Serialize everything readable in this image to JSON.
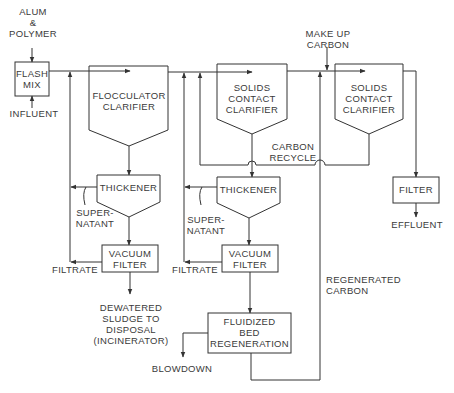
{
  "diagram": {
    "type": "process-flow",
    "colors": {
      "line": "#333333",
      "text": "#3a3a3a",
      "background": "#ffffff"
    },
    "units": [
      {
        "id": "flash_mix",
        "lines": [
          "FLASH",
          "MIX"
        ]
      },
      {
        "id": "flocculator_clarifier",
        "lines": [
          "FLOCCULATOR",
          "CLARIFIER"
        ]
      },
      {
        "id": "solids_contact_clarifier_1",
        "lines": [
          "SOLIDS",
          "CONTACT",
          "CLARIFIER"
        ]
      },
      {
        "id": "solids_contact_clarifier_2",
        "lines": [
          "SOLIDS",
          "CONTACT",
          "CLARIFIER"
        ]
      },
      {
        "id": "thickener_1",
        "lines": [
          "THICKENER"
        ]
      },
      {
        "id": "thickener_2",
        "lines": [
          "THICKENER"
        ]
      },
      {
        "id": "vacuum_filter_1",
        "lines": [
          "VACUUM",
          "FILTER"
        ]
      },
      {
        "id": "vacuum_filter_2",
        "lines": [
          "VACUUM",
          "FILTER"
        ]
      },
      {
        "id": "filter",
        "lines": [
          "FILTER"
        ]
      },
      {
        "id": "fluidized_bed_regeneration",
        "lines": [
          "FLUIDIZED",
          "BED",
          "REGENERATION"
        ]
      }
    ],
    "streams": [
      {
        "id": "alum_polymer",
        "lines": [
          "ALUM",
          "&",
          "POLYMER"
        ]
      },
      {
        "id": "influent",
        "lines": [
          "INFLUENT"
        ]
      },
      {
        "id": "make_up_carbon",
        "lines": [
          "MAKE UP",
          "CARBON"
        ]
      },
      {
        "id": "carbon_recycle",
        "lines": [
          "CARBON",
          "RECYCLE"
        ]
      },
      {
        "id": "supernatant_1",
        "lines": [
          "SUPER-",
          "NATANT"
        ]
      },
      {
        "id": "supernatant_2",
        "lines": [
          "SUPER-",
          "NATANT"
        ]
      },
      {
        "id": "filtrate_1",
        "lines": [
          "FILTRATE"
        ]
      },
      {
        "id": "filtrate_2",
        "lines": [
          "FILTRATE"
        ]
      },
      {
        "id": "effluent",
        "lines": [
          "EFFLUENT"
        ]
      },
      {
        "id": "regenerated_carbon",
        "lines": [
          "REGENERATED",
          "CARBON"
        ]
      },
      {
        "id": "dewatered_sludge",
        "lines": [
          "DEWATERED",
          "SLUDGE TO",
          "DISPOSAL",
          "(INCINERATOR)"
        ]
      },
      {
        "id": "blowdown",
        "lines": [
          "BLOWDOWN"
        ]
      }
    ]
  }
}
